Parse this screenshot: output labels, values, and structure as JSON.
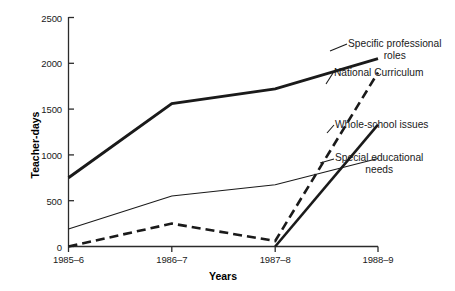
{
  "chart_data": {
    "type": "line",
    "title": "",
    "xlabel": "Years",
    "ylabel": "Teacher-days",
    "categories": [
      "1985–6",
      "1986–7",
      "1987–8",
      "1988–9"
    ],
    "ylim": [
      0,
      2500
    ],
    "yticks": [
      0,
      500,
      1000,
      1500,
      2000,
      2500
    ],
    "ytick_labels": [
      "0",
      "500",
      "1000",
      "1500",
      "2000",
      "2500"
    ],
    "grid": false,
    "legend_position": "right-inline-labels",
    "series": [
      {
        "name": "Specific professional roles",
        "style": "thick-solid",
        "values": [
          750,
          1560,
          1720,
          2050
        ]
      },
      {
        "name": "National Curriculum",
        "style": "thick-dashed",
        "values": [
          0,
          250,
          60,
          1900
        ]
      },
      {
        "name": "Whole-school issues",
        "style": "thick-solid-short",
        "values": [
          0,
          0,
          0,
          1330
        ]
      },
      {
        "name": "Special educational needs",
        "style": "thin-solid",
        "values": [
          190,
          550,
          675,
          960
        ]
      }
    ]
  },
  "axes": {
    "y_title": "Teacher-days",
    "x_title": "Years",
    "y_ticks": [
      "2500",
      "2000",
      "1500",
      "1000",
      "500",
      "0"
    ],
    "x_ticks": [
      "1985–6",
      "1986–7",
      "1987–8",
      "1988–9"
    ]
  },
  "labels": {
    "specific_professional_roles_line1": "Specific professional",
    "specific_professional_roles_line2": "roles",
    "national_curriculum": "National Curriculum",
    "whole_school_issues": "Whole-school issues",
    "special_educational_needs_line1": "Special educational",
    "special_educational_needs_line2": "needs"
  },
  "colors": {
    "ink": "#1a1a1a",
    "background": "#ffffff"
  }
}
